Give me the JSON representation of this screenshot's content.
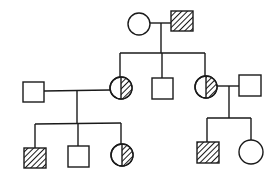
{
  "diagram": {
    "type": "pedigree",
    "colors": {
      "stroke": "#1a1a1a",
      "background": "#ffffff"
    },
    "individuals": [
      {
        "id": "I-1",
        "generation": 1,
        "sex": "female",
        "status": "unaffected",
        "cx": 139,
        "cy": 24
      },
      {
        "id": "I-2",
        "generation": 1,
        "sex": "male",
        "status": "affected",
        "cx": 182,
        "cy": 21
      },
      {
        "id": "II-1",
        "generation": 2,
        "sex": "male",
        "status": "unaffected",
        "cx": 33,
        "cy": 92
      },
      {
        "id": "II-2",
        "generation": 2,
        "sex": "female",
        "status": "carrier",
        "cx": 121,
        "cy": 88
      },
      {
        "id": "II-3",
        "generation": 2,
        "sex": "male",
        "status": "unaffected",
        "cx": 162,
        "cy": 88
      },
      {
        "id": "II-4",
        "generation": 2,
        "sex": "female",
        "status": "carrier",
        "cx": 206,
        "cy": 87
      },
      {
        "id": "II-5",
        "generation": 2,
        "sex": "male",
        "status": "unaffected",
        "cx": 250,
        "cy": 85
      },
      {
        "id": "III-1",
        "generation": 3,
        "sex": "male",
        "status": "affected",
        "cx": 35,
        "cy": 158
      },
      {
        "id": "III-2",
        "generation": 3,
        "sex": "male",
        "status": "unaffected",
        "cx": 78,
        "cy": 156
      },
      {
        "id": "III-3",
        "generation": 3,
        "sex": "female",
        "status": "carrier",
        "cx": 122,
        "cy": 155
      },
      {
        "id": "III-4",
        "generation": 3,
        "sex": "male",
        "status": "affected",
        "cx": 208,
        "cy": 152
      },
      {
        "id": "III-5",
        "generation": 3,
        "sex": "female",
        "status": "unaffected",
        "cx": 251,
        "cy": 152
      }
    ],
    "legend_semantics": {
      "square": "male",
      "circle": "female",
      "hatched": "affected",
      "half-hatched": "carrier"
    }
  }
}
